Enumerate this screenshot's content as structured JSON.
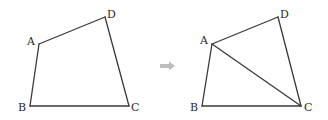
{
  "figures": [
    {
      "name": "quadrilateral",
      "vertices": [
        "A",
        "B",
        "C",
        "D"
      ],
      "labels": {
        "A": "A",
        "B": "B",
        "C": "C",
        "D": "D"
      },
      "diagonals": []
    },
    {
      "name": "quadrilateral-with-diagonal",
      "vertices": [
        "A",
        "B",
        "C",
        "D"
      ],
      "labels": {
        "A": "A",
        "B": "B",
        "C": "C",
        "D": "D"
      },
      "diagonals": [
        [
          "A",
          "C"
        ]
      ]
    }
  ],
  "transition": {
    "icon": "right-arrow-icon",
    "color": "#bdbdbd"
  },
  "colors": {
    "stroke": "#3a3a3a",
    "label": "#2a2a2a"
  }
}
